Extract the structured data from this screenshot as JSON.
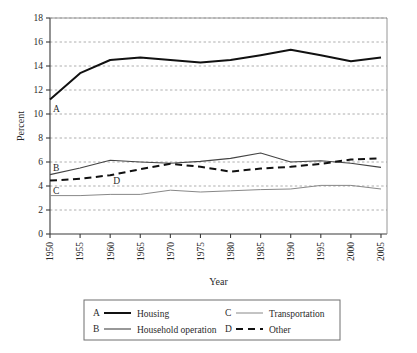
{
  "chart_data": {
    "type": "line",
    "title": "",
    "xlabel": "Year",
    "ylabel": "Percent",
    "xlim": [
      1950,
      2006
    ],
    "ylim": [
      0,
      18
    ],
    "ytick_step": 2,
    "yticks": [
      "0",
      "2",
      "4",
      "6",
      "8",
      "10",
      "12",
      "14",
      "16",
      "18"
    ],
    "xticks": [
      "1950",
      "1955",
      "1960",
      "1965",
      "1970",
      "1975",
      "1980",
      "1985",
      "1990",
      "1995",
      "2000",
      "2005"
    ],
    "x": [
      1950,
      1955,
      1960,
      1965,
      1970,
      1975,
      1980,
      1985,
      1990,
      1995,
      2000,
      2005
    ],
    "grid": "horizontal-dashed",
    "legend_position": "bottom",
    "series": [
      {
        "key": "A",
        "name": "Housing",
        "style": "solid-thick",
        "color": "#111111",
        "width": 2.0,
        "values": [
          11.2,
          13.4,
          14.5,
          14.7,
          14.5,
          14.3,
          14.5,
          14.9,
          15.35,
          14.9,
          14.4,
          14.7
        ],
        "label_x": 1950,
        "label_y": 10.5
      },
      {
        "key": "B",
        "name": "Household operation",
        "style": "solid-medium",
        "color": "#444444",
        "width": 1.1,
        "values": [
          4.95,
          5.5,
          6.15,
          6.0,
          5.9,
          6.05,
          6.3,
          6.75,
          6.0,
          6.1,
          5.9,
          5.55
        ],
        "label_x": 1950,
        "label_y": 5.55
      },
      {
        "key": "C",
        "name": "Transportation",
        "style": "solid-thin",
        "color": "#888888",
        "width": 1.0,
        "values": [
          3.2,
          3.2,
          3.3,
          3.3,
          3.65,
          3.5,
          3.6,
          3.7,
          3.75,
          4.05,
          4.05,
          3.75
        ],
        "label_x": 1950,
        "label_y": 3.6
      },
      {
        "key": "D",
        "name": "Other",
        "style": "dashed-thick",
        "color": "#111111",
        "width": 2.0,
        "values": [
          4.45,
          4.6,
          4.9,
          5.4,
          5.85,
          5.6,
          5.2,
          5.45,
          5.6,
          5.85,
          6.2,
          6.3
        ],
        "label_x": 1960,
        "label_y": 4.45
      }
    ]
  },
  "axes": {
    "y_title": "Percent",
    "x_title": "Year"
  },
  "legend": {
    "entries": [
      {
        "key": "A",
        "label": "Housing",
        "style": "solid-thick"
      },
      {
        "key": "C",
        "label": "Transportation",
        "style": "solid-thin"
      },
      {
        "key": "B",
        "label": "Household operation",
        "style": "solid-medium"
      },
      {
        "key": "D",
        "label": "Other",
        "style": "dashed-thick"
      }
    ]
  }
}
